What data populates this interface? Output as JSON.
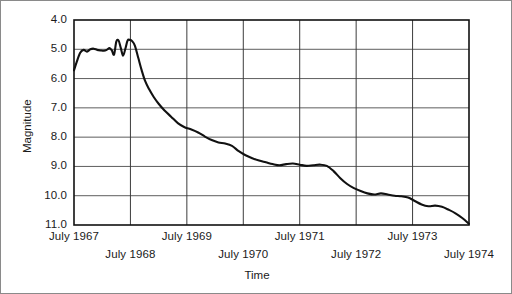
{
  "chart_data": {
    "type": "line",
    "title": "",
    "xlabel": "Time",
    "ylabel": "Magnitude",
    "grid": true,
    "legend": null,
    "y_inverted": true,
    "ylim": [
      4.0,
      11.0
    ],
    "xlim": [
      1967.5,
      1974.5
    ],
    "y_ticks": [
      "4.0",
      "5.0",
      "6.0",
      "7.0",
      "8.0",
      "9.0",
      "10.0",
      "11.0"
    ],
    "y_tick_values": [
      4.0,
      5.0,
      6.0,
      7.0,
      8.0,
      9.0,
      10.0,
      11.0
    ],
    "x_ticks": [
      "July 1967",
      "July 1968",
      "July 1969",
      "July 1970",
      "July 1971",
      "July 1972",
      "July 1973",
      "July 1974"
    ],
    "x_tick_values": [
      1967.5,
      1968.5,
      1969.5,
      1970.5,
      1971.5,
      1972.5,
      1973.5,
      1974.5
    ],
    "series": [
      {
        "name": "Magnitude",
        "color": "#111111",
        "x": [
          1967.5,
          1967.55,
          1967.61,
          1967.67,
          1967.73,
          1967.79,
          1967.85,
          1967.91,
          1967.97,
          1968.03,
          1968.08,
          1968.13,
          1968.17,
          1968.21,
          1968.25,
          1968.29,
          1968.33,
          1968.37,
          1968.41,
          1968.45,
          1968.49,
          1968.53,
          1968.58,
          1968.64,
          1968.7,
          1968.76,
          1968.83,
          1968.91,
          1969.0,
          1969.1,
          1969.22,
          1969.34,
          1969.46,
          1969.58,
          1969.7,
          1969.82,
          1969.94,
          1970.06,
          1970.18,
          1970.3,
          1970.42,
          1970.54,
          1970.66,
          1970.78,
          1970.9,
          1971.02,
          1971.14,
          1971.26,
          1971.38,
          1971.5,
          1971.62,
          1971.74,
          1971.86,
          1971.98,
          1972.1,
          1972.22,
          1972.34,
          1972.46,
          1972.58,
          1972.7,
          1972.82,
          1972.94,
          1973.06,
          1973.18,
          1973.3,
          1973.42,
          1973.54,
          1973.66,
          1973.78,
          1973.9,
          1974.02,
          1974.14,
          1974.26,
          1974.38,
          1974.5
        ],
        "y": [
          5.72,
          5.42,
          5.12,
          5.02,
          5.08,
          5.0,
          4.98,
          5.02,
          5.04,
          5.05,
          5.02,
          4.96,
          5.04,
          5.18,
          4.74,
          4.7,
          4.96,
          5.22,
          4.98,
          4.7,
          4.68,
          4.72,
          4.88,
          5.3,
          5.72,
          6.08,
          6.36,
          6.62,
          6.86,
          7.08,
          7.3,
          7.52,
          7.66,
          7.74,
          7.84,
          7.98,
          8.1,
          8.18,
          8.22,
          8.3,
          8.48,
          8.62,
          8.72,
          8.8,
          8.86,
          8.92,
          8.96,
          8.92,
          8.9,
          8.94,
          8.98,
          8.96,
          8.94,
          8.98,
          9.16,
          9.4,
          9.6,
          9.74,
          9.84,
          9.92,
          9.96,
          9.92,
          9.96,
          10.0,
          10.02,
          10.06,
          10.18,
          10.3,
          10.36,
          10.34,
          10.38,
          10.48,
          10.6,
          10.76,
          10.96
        ]
      }
    ]
  },
  "axes": {
    "y_title": "Magnitude",
    "x_title": "Time"
  }
}
